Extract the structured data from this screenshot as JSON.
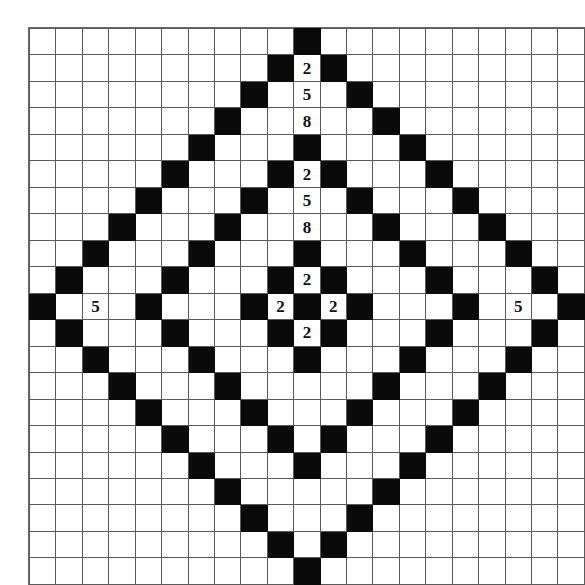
{
  "figure": {
    "type": "grid-pattern",
    "caption": ""
  },
  "grid": {
    "rows": 21,
    "cols": 21,
    "center_row": 10,
    "center_col": 10,
    "cell_size_px": 25.4,
    "fill_color": "#0a0a0a",
    "empty_color": "#ffffff",
    "line_color": "#5a5a5a",
    "rule": "filled where (|r-10| + |c-10|) is in [0, 2, 6, 10]",
    "filled_distances": [
      0,
      2,
      6,
      10
    ],
    "labels": [
      {
        "row": 1,
        "col": 10,
        "text": "2"
      },
      {
        "row": 2,
        "col": 10,
        "text": "5"
      },
      {
        "row": 3,
        "col": 10,
        "text": "8"
      },
      {
        "row": 5,
        "col": 10,
        "text": "2"
      },
      {
        "row": 6,
        "col": 10,
        "text": "5"
      },
      {
        "row": 7,
        "col": 10,
        "text": "8"
      },
      {
        "row": 9,
        "col": 10,
        "text": "2"
      },
      {
        "row": 10,
        "col": 9,
        "text": "2"
      },
      {
        "row": 10,
        "col": 11,
        "text": "2"
      },
      {
        "row": 11,
        "col": 10,
        "text": "2"
      },
      {
        "row": 10,
        "col": 2,
        "text": "5"
      },
      {
        "row": 10,
        "col": 18,
        "text": "5"
      }
    ]
  }
}
